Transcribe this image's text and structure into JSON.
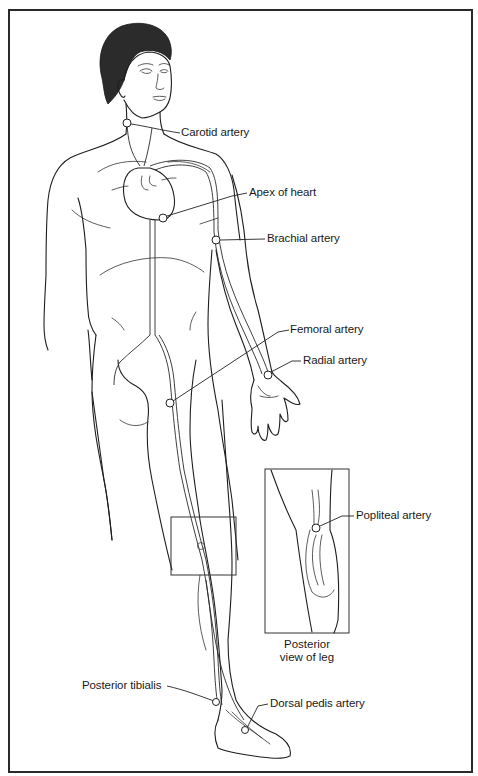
{
  "labels": [
    {
      "id": "carotid",
      "text": "Carotid artery",
      "x": 181,
      "y": 128,
      "point": [
        127,
        123
      ]
    },
    {
      "id": "apex",
      "text": "Apex of heart",
      "x": 249,
      "y": 188,
      "point": [
        163,
        218
      ]
    },
    {
      "id": "brachial",
      "text": "Brachial artery",
      "x": 267,
      "y": 234,
      "point": [
        216,
        240
      ]
    },
    {
      "id": "femoral",
      "text": "Femoral artery",
      "x": 290,
      "y": 325,
      "point": [
        170,
        403
      ]
    },
    {
      "id": "radial",
      "text": "Radial artery",
      "x": 303,
      "y": 356,
      "point": [
        268,
        375
      ]
    },
    {
      "id": "popliteal",
      "text": "Popliteal artery",
      "x": 356,
      "y": 511,
      "point": [
        316,
        528
      ]
    },
    {
      "id": "posterior_tibialis",
      "text": "Posterior tibialis",
      "x": 82,
      "y": 681,
      "point": [
        216,
        702
      ]
    },
    {
      "id": "dorsal_pedis",
      "text": "Dorsal pedis artery",
      "x": 270,
      "y": 699,
      "point": [
        245,
        730
      ]
    }
  ],
  "inset": {
    "caption_line1": "Posterior",
    "caption_line2": "view of leg"
  },
  "colors": {
    "line": "#1e1e1e",
    "background": "#ffffff",
    "border": "#2a2a2a"
  }
}
